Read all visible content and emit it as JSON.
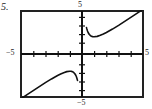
{
  "problem": {
    "number": "5."
  },
  "axis_labels": {
    "x_min": "−5",
    "x_max": "5",
    "y_min": "−5",
    "y_max": "5"
  },
  "chart_data": {
    "type": "line",
    "title": "",
    "subtitle": "",
    "xlabel": "",
    "ylabel": "",
    "xlim": [
      -5,
      5
    ],
    "ylim": [
      -5,
      5
    ],
    "grid": false,
    "legend": "none",
    "frame": "box",
    "x_ticks": [
      -4,
      -3,
      -2,
      -1,
      1,
      2,
      3,
      4
    ],
    "y_ticks": [
      -4,
      -3,
      -2,
      -1,
      1,
      2,
      3,
      4
    ],
    "x_tick_labels": [
      "−5",
      "5"
    ],
    "y_tick_labels": [
      "−5",
      "5"
    ],
    "function": "f(x) = x + 1/x",
    "asymptotes": {
      "vertical": [
        0
      ],
      "oblique": "y = x"
    },
    "series": [
      {
        "name": "branch-left",
        "comment": "x < 0 branch: rises from lower-left, local maximum at (-1, -2), falls steeply to vertical asymptote x = 0",
        "x": [
          -5.0,
          -4.5,
          -4.0,
          -3.5,
          -3.0,
          -2.5,
          -2.0,
          -1.75,
          -1.5,
          -1.25,
          -1.0,
          -0.9,
          -0.8,
          -0.7,
          -0.6,
          -0.5,
          -0.45,
          -0.4,
          -0.37
        ],
        "y": [
          -5.2,
          -4.72,
          -4.25,
          -3.79,
          -3.33,
          -2.9,
          -2.5,
          -2.32,
          -2.17,
          -2.05,
          -2.0,
          -2.011,
          -2.05,
          -2.129,
          -2.267,
          -2.5,
          -2.672,
          -2.9,
          -3.07
        ]
      },
      {
        "name": "branch-right",
        "comment": "x > 0 branch: falls steeply from vertical asymptote x = 0, local minimum at (1, 2), rises toward oblique asymptote y = x",
        "x": [
          0.37,
          0.4,
          0.45,
          0.5,
          0.6,
          0.7,
          0.8,
          0.9,
          1.0,
          1.25,
          1.5,
          1.75,
          2.0,
          2.5,
          3.0,
          3.5,
          4.0,
          4.5,
          5.0
        ],
        "y": [
          3.07,
          2.9,
          2.672,
          2.5,
          2.267,
          2.129,
          2.05,
          2.011,
          2.0,
          2.05,
          2.17,
          2.32,
          2.5,
          2.9,
          3.33,
          3.79,
          4.25,
          4.72,
          5.2
        ]
      }
    ]
  },
  "colors": {
    "curve": "#111111",
    "axis": "#111111",
    "frame": "#222222",
    "background": "#ffffff",
    "text": "#1c1c1c"
  }
}
